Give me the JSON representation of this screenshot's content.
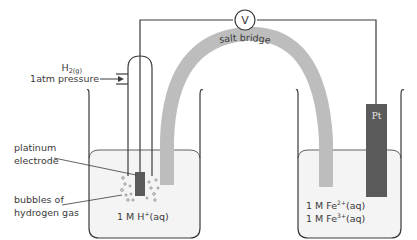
{
  "diagram": {
    "voltmeter": {
      "symbol": "V"
    },
    "salt_bridge": {
      "label": "salt bridge"
    },
    "left_cell": {
      "gas_label_main": "H",
      "gas_label_sub": "2(g)",
      "pressure_label": "1atm pressure",
      "electrode_label_line1": "platinum",
      "electrode_label_line2": "electrode",
      "bubbles_label_line1": "bubbles of",
      "bubbles_label_line2": "hydrogen gas",
      "solution_main": "1 M H",
      "solution_sup": "+",
      "solution_tail": "(aq)"
    },
    "right_cell": {
      "electrode_label": "Pt",
      "solution1_main": "1 M Fe",
      "solution1_sup": "2+",
      "solution1_tail": "(aq)",
      "solution2_main": "1 M Fe",
      "solution2_sup": "3+",
      "solution2_tail": "(aq)"
    },
    "colors": {
      "line": "#3a3a3a",
      "salt_bridge": "#bdbdbd",
      "electrode": "#5a5a5a",
      "solution": "#f4f4f4"
    }
  }
}
